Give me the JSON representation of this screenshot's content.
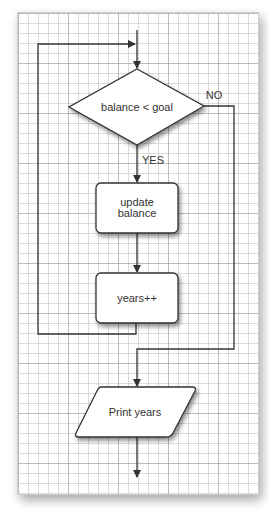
{
  "diagram": {
    "type": "flowchart",
    "nodes": {
      "decision": {
        "label": "balance < goal",
        "shape": "diamond"
      },
      "update": {
        "line1": "update",
        "line2": "balance",
        "shape": "rounded-rect"
      },
      "increment": {
        "label": "years++",
        "shape": "rounded-rect"
      },
      "output": {
        "label": "Print years",
        "shape": "parallelogram"
      }
    },
    "edges": {
      "yes_label": "YES",
      "no_label": "NO"
    },
    "colors": {
      "stroke": "#333333",
      "fill": "#ffffff",
      "grid": "#bebebe"
    }
  }
}
